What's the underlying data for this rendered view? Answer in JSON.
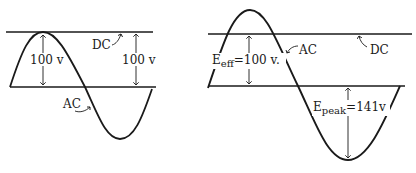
{
  "left_panel": {
    "dc_label": "DC",
    "ac_label": "AC",
    "ac_peak_label": "100 v",
    "dc_level_label": "100 v"
  },
  "right_panel": {
    "dc_label": "DC",
    "ac_label": "AC",
    "e_eff_prefix": "E",
    "e_eff_sub": "eff",
    "e_eff_value": "=100 v.",
    "e_peak_prefix": "E",
    "e_peak_sub": "peak",
    "e_peak_value": "=141v"
  },
  "colors": {
    "ink": "#1a1a1a",
    "background": "#ffffff"
  }
}
